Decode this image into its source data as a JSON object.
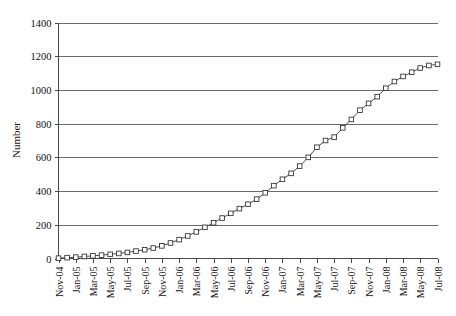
{
  "chart_data": {
    "type": "line",
    "title": "",
    "xlabel": "",
    "ylabel": "Number",
    "ylim": [
      0,
      1400
    ],
    "ytick_step": 200,
    "ytick_labels": [
      "0",
      "200",
      "400",
      "600",
      "800",
      "1000",
      "1200",
      "1400"
    ],
    "grid": true,
    "grid_axis": "y",
    "legend": "none",
    "marker": "open-square",
    "x": [
      "Nov-04",
      "Dec-04",
      "Jan-05",
      "Feb-05",
      "Mar-05",
      "Apr-05",
      "May-05",
      "Jun-05",
      "Jul-05",
      "Aug-05",
      "Sep-05",
      "Oct-05",
      "Nov-05",
      "Dec-05",
      "Jan-06",
      "Feb-06",
      "Mar-06",
      "Apr-06",
      "May-06",
      "Jun-06",
      "Jul-06",
      "Aug-06",
      "Sep-06",
      "Oct-06",
      "Nov-06",
      "Dec-06",
      "Jan-07",
      "Feb-07",
      "Mar-07",
      "Apr-07",
      "May-07",
      "Jun-07",
      "Jul-07",
      "Aug-07",
      "Sep-07",
      "Oct-07",
      "Nov-07",
      "Dec-07",
      "Jan-08",
      "Feb-08",
      "Mar-08",
      "Apr-08",
      "May-08",
      "Jun-08",
      "Jul-08"
    ],
    "xtick_labels": [
      "Nov-04",
      "Jan-05",
      "Mar-05",
      "May-05",
      "Jul-05",
      "Sep-05",
      "Nov-05",
      "Jan-06",
      "Mar-06",
      "May-06",
      "Jul-06",
      "Sep-06",
      "Nov-06",
      "Jan-07",
      "Mar-07",
      "May-07",
      "Jul-07",
      "Sep-07",
      "Nov-07",
      "Jan-08",
      "Mar-08",
      "May-08",
      "Jul-08"
    ],
    "xtick_interval_months": 2,
    "values": [
      2,
      5,
      8,
      12,
      16,
      20,
      25,
      30,
      36,
      44,
      52,
      62,
      75,
      92,
      112,
      134,
      158,
      185,
      212,
      240,
      268,
      296,
      322,
      352,
      390,
      432,
      470,
      505,
      548,
      600,
      660,
      700,
      720,
      775,
      825,
      880,
      920,
      960,
      1010,
      1050,
      1080,
      1105,
      1130,
      1145,
      1152
    ],
    "series": [
      {
        "name": "Number",
        "values": [
          2,
          5,
          8,
          12,
          16,
          20,
          25,
          30,
          36,
          44,
          52,
          62,
          75,
          92,
          112,
          134,
          158,
          185,
          212,
          240,
          268,
          296,
          322,
          352,
          390,
          432,
          470,
          505,
          548,
          600,
          660,
          700,
          720,
          775,
          825,
          880,
          920,
          960,
          1010,
          1050,
          1080,
          1105,
          1130,
          1145,
          1152
        ]
      }
    ]
  },
  "colors": {
    "grid": "#6b6b6b",
    "axis": "#4a4a4a",
    "line": "#3a3a3a",
    "marker_fill": "#ffffff",
    "background": "#ffffff"
  }
}
